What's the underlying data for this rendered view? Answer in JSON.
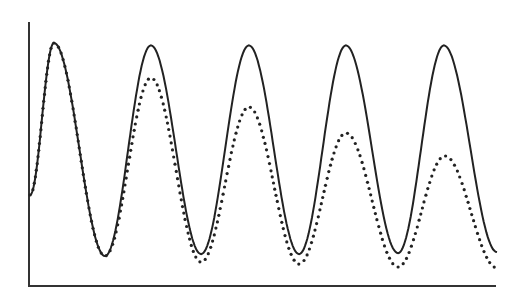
{
  "chart_data": {
    "type": "line",
    "title": "",
    "xlabel": "",
    "ylabel": "",
    "grid": false,
    "legend": null,
    "xlim": [
      0,
      4.8
    ],
    "ylim": [
      0,
      1.0
    ],
    "axes": {
      "left": true,
      "bottom": true,
      "ticks": false,
      "tick_labels": false
    },
    "series": [
      {
        "name": "solid",
        "style": "solid",
        "color": "#222222",
        "peaks_x": [
          0.245,
          1.24,
          2.245,
          3.24,
          4.245
        ],
        "peaks_y": [
          1.0,
          0.99,
          0.99,
          0.99,
          0.99
        ],
        "troughs_x": [
          0.77,
          1.755,
          2.76,
          3.775
        ],
        "troughs_y": [
          0.127,
          0.135,
          0.135,
          0.139
        ],
        "start": [
          0.0,
          0.377
        ],
        "end": [
          4.79,
          0.143
        ]
      },
      {
        "name": "dotted",
        "style": "dotted",
        "color": "#222222",
        "peaks_x": [
          0.245,
          1.24,
          2.245,
          3.24,
          4.255
        ],
        "peaks_y": [
          1.0,
          0.857,
          0.738,
          0.631,
          0.537
        ],
        "troughs_x": [
          0.77,
          1.755,
          2.76,
          3.775
        ],
        "troughs_y": [
          0.127,
          0.102,
          0.094,
          0.082
        ],
        "start": [
          0.0,
          0.377
        ],
        "end": [
          4.79,
          0.078
        ]
      }
    ]
  },
  "plot": {
    "px_left": 29,
    "px_right": 496,
    "px_top": 22,
    "px_bottom": 287,
    "y_unit_px": 244,
    "x_unit_px": 97.5
  }
}
